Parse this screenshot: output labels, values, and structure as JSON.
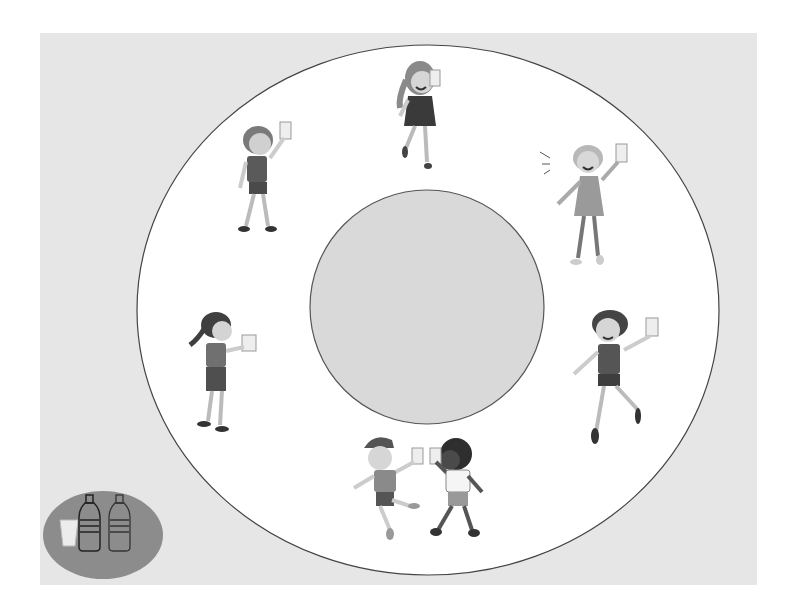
{
  "scene": {
    "description": "Circle-time diagram: six children holding cups of water arranged around a central circular table, with a tray holding a cup and two water bottles in the bottom-left corner",
    "colors": {
      "page": "#ffffff",
      "panel": "#e6e6e6",
      "outer_ring": "#ffffff",
      "ring_outline": "#444444",
      "center_table": "#d9d9d9",
      "tray": "#8c8c8c"
    }
  },
  "center_table": {
    "label": "center-table"
  },
  "outer_ring": {
    "label": "seating-ring"
  },
  "children": [
    {
      "id": "girl-top",
      "position": "top",
      "holding": "cup"
    },
    {
      "id": "boy-top-left",
      "position": "upper-left",
      "holding": "cup"
    },
    {
      "id": "girl-top-right",
      "position": "upper-right",
      "holding": "cup"
    },
    {
      "id": "girl-left",
      "position": "left",
      "holding": "cup"
    },
    {
      "id": "boy-right",
      "position": "right",
      "holding": "cup"
    },
    {
      "id": "boys-bottom",
      "position": "bottom",
      "holding": "cups",
      "count": 2
    }
  ],
  "tray": {
    "items": [
      "cup",
      "water-bottle",
      "water-bottle"
    ]
  }
}
